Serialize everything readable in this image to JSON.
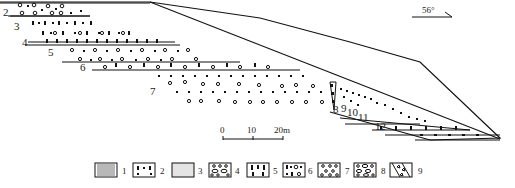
{
  "diagram": {
    "type": "geological-cross-section",
    "orientation": {
      "dip_label": "56°"
    },
    "layers": [
      {
        "id": "2",
        "label": "2",
        "pattern": "circles-dots"
      },
      {
        "id": "3",
        "label": "3",
        "pattern": "bars-circles"
      },
      {
        "id": "4",
        "label": "4",
        "pattern": "bars"
      },
      {
        "id": "5",
        "label": "5",
        "pattern": "circles-dots"
      },
      {
        "id": "6",
        "label": "6",
        "pattern": "bars-circles"
      },
      {
        "id": "7",
        "label": "7",
        "pattern": "dots-circles"
      },
      {
        "id": "8",
        "label": "8",
        "pattern": "breccia"
      },
      {
        "id": "9",
        "label": "9",
        "pattern": "dots"
      },
      {
        "id": "10",
        "label": "10",
        "pattern": "dots-circles"
      },
      {
        "id": "11",
        "label": "11",
        "pattern": "bars"
      },
      {
        "id": "12",
        "label": "12",
        "pattern": "bars-dots"
      }
    ],
    "scale_bar": {
      "ticks": [
        "0",
        "10",
        "20m"
      ]
    },
    "legend": [
      {
        "number": "1",
        "pattern": "vertical-lines"
      },
      {
        "number": "2",
        "pattern": "bars-dots"
      },
      {
        "number": "3",
        "pattern": "fine-dots"
      },
      {
        "number": "4",
        "pattern": "ovals-circles"
      },
      {
        "number": "5",
        "pattern": "thick-bars"
      },
      {
        "number": "6",
        "pattern": "bars-circles-dots"
      },
      {
        "number": "7",
        "pattern": "scattered-circles"
      },
      {
        "number": "8",
        "pattern": "large-ovals"
      },
      {
        "number": "9",
        "pattern": "breccia-diagonal"
      }
    ],
    "colors": {
      "ink": "#111111",
      "background": "#ffffff"
    }
  }
}
